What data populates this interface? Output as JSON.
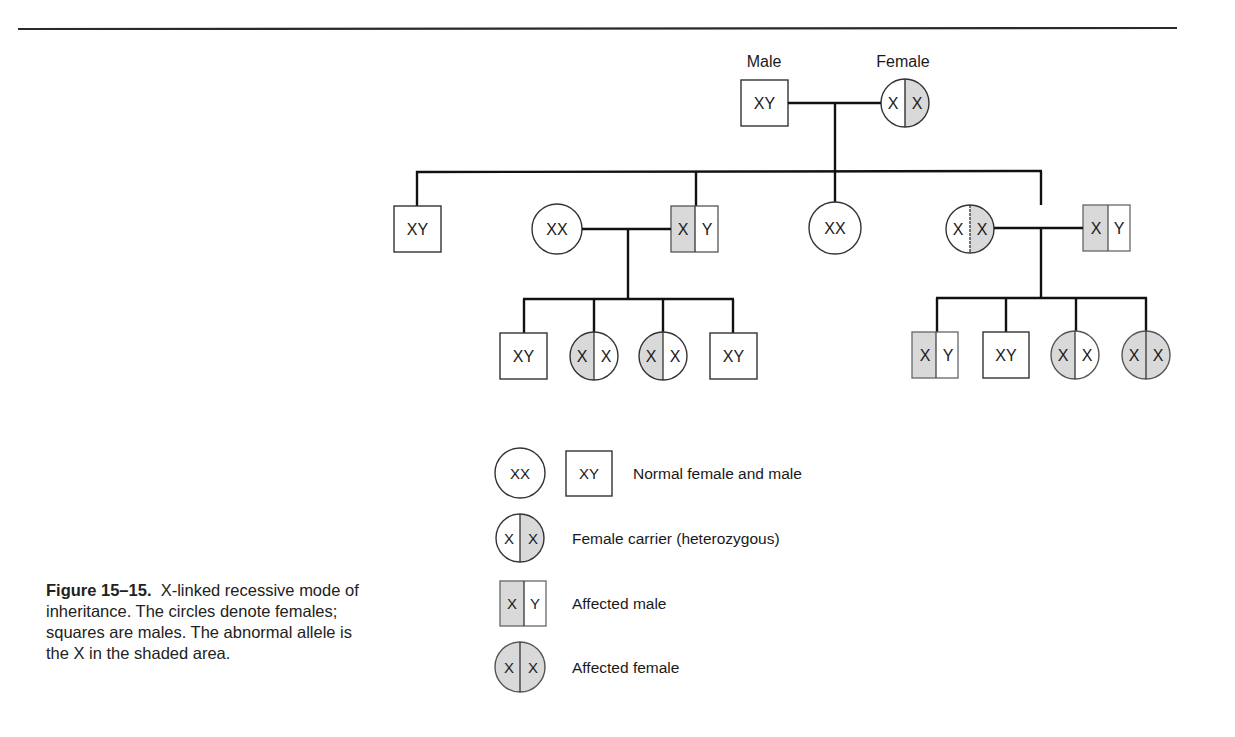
{
  "figure": {
    "caption": {
      "label": "Figure 15–15.",
      "text": "X-linked recessive mode of inheritance. The circles denote females; squares are males. The abnormal allele is the X in the shaded area."
    }
  },
  "colors": {
    "shade": "#d9d9d9",
    "line": "#1a1a1a",
    "background": "#ffffff"
  },
  "pedigree": {
    "generation_1": {
      "labels": {
        "male": "Male",
        "female": "Female"
      },
      "individuals": [
        {
          "id": "g1-father",
          "sex": "male",
          "status": "normal",
          "alleles": [
            "X",
            "Y"
          ]
        },
        {
          "id": "g1-mother",
          "sex": "female",
          "status": "carrier",
          "alleles": [
            "X",
            "X"
          ],
          "shaded": "right"
        }
      ]
    },
    "generation_2": {
      "individuals": [
        {
          "id": "g2-son-1",
          "sex": "male",
          "status": "normal",
          "alleles": [
            "X",
            "Y"
          ]
        },
        {
          "id": "g2-spouse-1",
          "sex": "female",
          "status": "normal",
          "alleles": [
            "X",
            "X"
          ],
          "married_in": true
        },
        {
          "id": "g2-son-2",
          "sex": "male",
          "status": "affected",
          "alleles": [
            "X",
            "Y"
          ],
          "shaded": "left"
        },
        {
          "id": "g2-daughter-1",
          "sex": "female",
          "status": "normal",
          "alleles": [
            "X",
            "X"
          ]
        },
        {
          "id": "g2-daughter-2",
          "sex": "female",
          "status": "carrier",
          "alleles": [
            "X",
            "X"
          ],
          "shaded": "right"
        },
        {
          "id": "g2-spouse-2",
          "sex": "male",
          "status": "affected",
          "alleles": [
            "X",
            "Y"
          ],
          "shaded": "left",
          "married_in": true
        }
      ]
    },
    "generation_3_left": {
      "parents": [
        "g2-spouse-1",
        "g2-son-2"
      ],
      "individuals": [
        {
          "id": "g3l-1",
          "sex": "male",
          "status": "normal",
          "alleles": [
            "X",
            "Y"
          ]
        },
        {
          "id": "g3l-2",
          "sex": "female",
          "status": "carrier",
          "alleles": [
            "X",
            "X"
          ],
          "shaded": "left"
        },
        {
          "id": "g3l-3",
          "sex": "female",
          "status": "carrier",
          "alleles": [
            "X",
            "X"
          ],
          "shaded": "left"
        },
        {
          "id": "g3l-4",
          "sex": "male",
          "status": "normal",
          "alleles": [
            "X",
            "Y"
          ]
        }
      ]
    },
    "generation_3_right": {
      "parents": [
        "g2-daughter-2",
        "g2-spouse-2"
      ],
      "individuals": [
        {
          "id": "g3r-1",
          "sex": "male",
          "status": "affected",
          "alleles": [
            "X",
            "Y"
          ],
          "shaded": "left"
        },
        {
          "id": "g3r-2",
          "sex": "male",
          "status": "normal",
          "alleles": [
            "X",
            "Y"
          ]
        },
        {
          "id": "g3r-3",
          "sex": "female",
          "status": "carrier",
          "alleles": [
            "X",
            "X"
          ],
          "shaded": "left"
        },
        {
          "id": "g3r-4",
          "sex": "female",
          "status": "affected",
          "alleles": [
            "X",
            "X"
          ],
          "shaded": "both"
        }
      ]
    }
  },
  "legend": [
    {
      "symbols": [
        "XX",
        "XY"
      ],
      "label": "Normal female and male"
    },
    {
      "symbols": [
        "X|X"
      ],
      "label": "Female carrier (heterozygous)"
    },
    {
      "symbols": [
        "X|Y"
      ],
      "label": "Affected male"
    },
    {
      "symbols": [
        "X|X"
      ],
      "label": "Affected female"
    }
  ]
}
